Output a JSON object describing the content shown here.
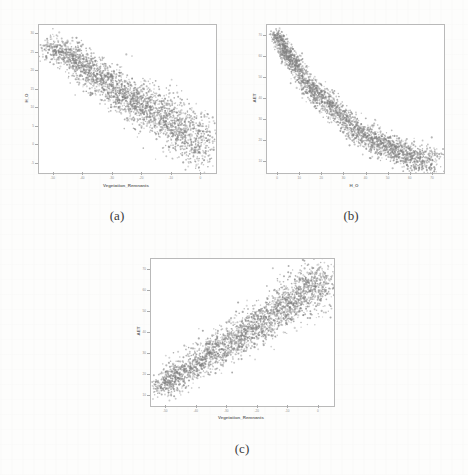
{
  "figure": {
    "background_color": "#fdfdfc",
    "point_color": "#808080",
    "frame_color": "#b9b9b9",
    "panels": [
      {
        "caption": "(a)",
        "xlabel": "Vegetation_Remnants",
        "ylabel": "H_O",
        "x_ticks": [
          "-50",
          "-40",
          "-30",
          "-20",
          "-10",
          "0"
        ],
        "y_ticks": [
          "-5",
          "0",
          "5",
          "10",
          "15",
          "20",
          "25",
          "30"
        ]
      },
      {
        "caption": "(b)",
        "xlabel": "H_O",
        "ylabel": "AET",
        "x_ticks": [
          "0",
          "10",
          "20",
          "30",
          "40",
          "50",
          "60",
          "70"
        ],
        "y_ticks": [
          "10",
          "20",
          "30",
          "40",
          "50",
          "60",
          "70"
        ]
      },
      {
        "caption": "(c)",
        "xlabel": "Vegetation_Remnants",
        "ylabel": "AET",
        "x_ticks": [
          "-50",
          "-40",
          "-30",
          "-20",
          "-10",
          "0"
        ],
        "y_ticks": [
          "10",
          "20",
          "30",
          "40",
          "50",
          "60",
          "70"
        ]
      }
    ]
  },
  "chart_data": [
    {
      "type": "scatter",
      "title": "(a)",
      "xlabel": "Vegetation_Remnants",
      "ylabel": "H_O",
      "xlim": [
        -55,
        2
      ],
      "ylim": [
        -7,
        32
      ],
      "grid": false,
      "legend": "none",
      "marker_color": "#808080",
      "relationship": "negative",
      "n_points_approx": 2600,
      "description": "Dense elongated cloud sloping downward from upper-left to lower-right; H_O decreases as Vegetation_Remnants increases toward 0.",
      "trend_points": [
        {
          "x": -52,
          "y": 26
        },
        {
          "x": -45,
          "y": 24
        },
        {
          "x": -40,
          "y": 21
        },
        {
          "x": -35,
          "y": 18
        },
        {
          "x": -30,
          "y": 15
        },
        {
          "x": -25,
          "y": 12
        },
        {
          "x": -20,
          "y": 10
        },
        {
          "x": -15,
          "y": 8
        },
        {
          "x": -10,
          "y": 5
        },
        {
          "x": -5,
          "y": 2
        },
        {
          "x": -1,
          "y": 0
        }
      ]
    },
    {
      "type": "scatter",
      "title": "(b)",
      "xlabel": "H_O",
      "ylabel": "AET",
      "xlim": [
        -2,
        74
      ],
      "ylim": [
        7,
        76
      ],
      "grid": false,
      "legend": "none",
      "marker_color": "#808080",
      "relationship": "negative",
      "n_points_approx": 2600,
      "description": "Steeply decreasing curved band from upper-left to lower-right; AET falls sharply as H_O rises, flattening near the right edge.",
      "trend_points": [
        {
          "x": 2,
          "y": 72
        },
        {
          "x": 6,
          "y": 64
        },
        {
          "x": 10,
          "y": 57
        },
        {
          "x": 16,
          "y": 48
        },
        {
          "x": 22,
          "y": 41
        },
        {
          "x": 30,
          "y": 33
        },
        {
          "x": 38,
          "y": 26
        },
        {
          "x": 46,
          "y": 21
        },
        {
          "x": 54,
          "y": 17
        },
        {
          "x": 62,
          "y": 14
        },
        {
          "x": 70,
          "y": 12
        }
      ]
    },
    {
      "type": "scatter",
      "title": "(c)",
      "xlabel": "Vegetation_Remnants",
      "ylabel": "AET",
      "xlim": [
        -55,
        2
      ],
      "ylim": [
        7,
        78
      ],
      "grid": false,
      "legend": "none",
      "marker_color": "#808080",
      "relationship": "positive",
      "n_points_approx": 2600,
      "description": "Broad cloud rising from lower-left to upper-right; AET increases with Vegetation_Remnants, spread widening toward the upper right.",
      "trend_points": [
        {
          "x": -52,
          "y": 16
        },
        {
          "x": -46,
          "y": 22
        },
        {
          "x": -40,
          "y": 28
        },
        {
          "x": -34,
          "y": 34
        },
        {
          "x": -28,
          "y": 40
        },
        {
          "x": -22,
          "y": 46
        },
        {
          "x": -16,
          "y": 52
        },
        {
          "x": -10,
          "y": 58
        },
        {
          "x": -6,
          "y": 64
        },
        {
          "x": -2,
          "y": 70
        }
      ]
    }
  ]
}
